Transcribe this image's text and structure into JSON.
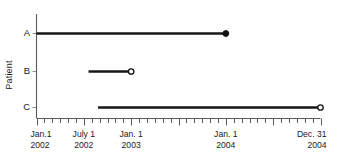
{
  "chart_data": {
    "type": "timeline",
    "title": "",
    "xlabel": "",
    "ylabel": "Patient",
    "categories": [
      "A",
      "B",
      "C"
    ],
    "x_axis": {
      "start": "Jan.1 2002",
      "end": "Dec. 31 2004",
      "unit": "months",
      "total_months": 36,
      "major_tick_interval_months": 6,
      "minor_tick_interval_months": 1,
      "grid": false
    },
    "tick_labels": [
      {
        "line1": "Jan.1",
        "line2": "2002",
        "month_index": 0
      },
      {
        "line1": "July 1",
        "line2": "2002",
        "month_index": 6
      },
      {
        "line1": "Jan. 1",
        "line2": "2003",
        "month_index": 12
      },
      {
        "line1": "Jan. 1",
        "line2": "2004",
        "month_index": 24
      },
      {
        "line1": "Dec. 31",
        "line2": "2004",
        "month_index": 36
      }
    ],
    "series": [
      {
        "name": "A",
        "start_month": 0,
        "end_month": 24,
        "start_label": "Jan.1 2002",
        "end_label": "Jan. 1 2004",
        "end_marker": "filled-circle",
        "start_marker": "none"
      },
      {
        "name": "B",
        "start_month": 6.6,
        "end_month": 12,
        "start_label": "July 2002",
        "end_label": "Jan. 1 2003",
        "end_marker": "open-circle",
        "start_marker": "none"
      },
      {
        "name": "C",
        "start_month": 7.8,
        "end_month": 36,
        "start_label": "Aug 2002",
        "end_label": "Dec. 31 2004",
        "end_marker": "open-circle",
        "start_marker": "none"
      }
    ],
    "colors": {
      "line": "#161616",
      "axis": "#555a5e",
      "text": "#1a1a1a",
      "background": "#ffffff"
    }
  }
}
